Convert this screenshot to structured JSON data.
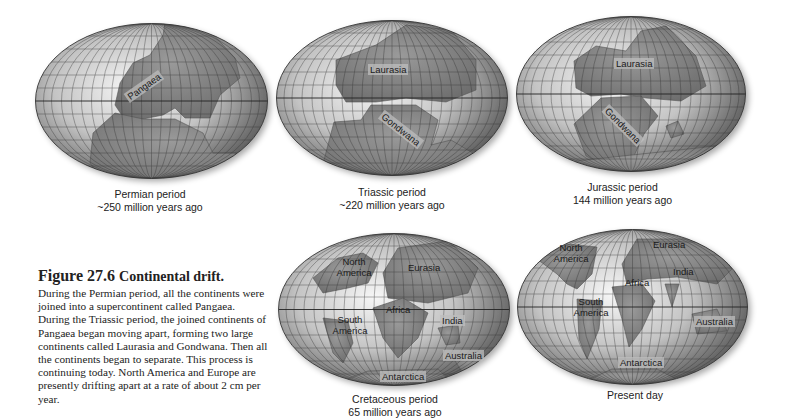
{
  "figure": {
    "number": "Figure 27.6",
    "title": "Continental drift.",
    "body": "During the Permian period, all the continents were joined into a supercontinent called Pangaea. During the Triassic period, the joined continents of Pangaea began moving apart, forming two large continents called Laurasia and Gondwana. Then all the continents began to separate. This process is continuing today. North America and Europe are presently drifting apart at a rate of about 2 cm per year."
  },
  "maps": [
    {
      "id": "permian",
      "caption_line1": "Permian period",
      "caption_line2": "~250 million years ago",
      "labels": [
        "Pangaea"
      ]
    },
    {
      "id": "triassic",
      "caption_line1": "Triassic period",
      "caption_line2": "~220 million years ago",
      "labels": [
        "Laurasia",
        "Gondwana"
      ]
    },
    {
      "id": "jurassic",
      "caption_line1": "Jurassic period",
      "caption_line2": "144 million years ago",
      "labels": [
        "Laurasia",
        "Gondwana"
      ]
    },
    {
      "id": "cretaceous",
      "caption_line1": "Cretaceous period",
      "caption_line2": "65 million years ago",
      "labels": [
        "North America",
        "Eurasia",
        "Africa",
        "South America",
        "India",
        "Australia",
        "Antarctica"
      ]
    },
    {
      "id": "present",
      "caption_line1": "Present day",
      "caption_line2": "",
      "labels": [
        "North America",
        "Eurasia",
        "India",
        "Africa",
        "South America",
        "Australia",
        "Antarctica"
      ]
    }
  ],
  "colors": {
    "ocean_light": "#f2f2f2",
    "ocean_dark": "#6e6e6e",
    "land": "#8a8a8a",
    "grid": "#333333",
    "text": "#222222"
  }
}
